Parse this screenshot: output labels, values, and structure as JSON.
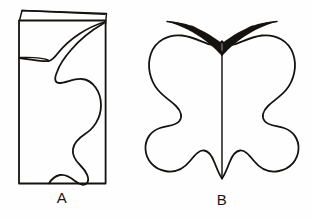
{
  "figure": {
    "background_color": "#fefefe",
    "ink_color": "#15120f",
    "panels": [
      {
        "id": "panel-a",
        "label": "A",
        "description": "Folded sheet of paper with one half of a butterfly outline drawn against the fold",
        "elements": [
          "folded-flap",
          "paper-rectangle",
          "half-butterfly-outline",
          "antenna-half"
        ]
      },
      {
        "id": "panel-b",
        "label": "B",
        "description": "Opened symmetrical butterfly shape with centre fold line and two antennae",
        "elements": [
          "butterfly-outline",
          "fold-centerline",
          "antenna-left",
          "antenna-right"
        ]
      }
    ]
  },
  "captions": {
    "panel_a_label": "A",
    "panel_b_label": "B"
  }
}
